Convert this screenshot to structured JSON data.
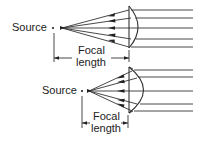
{
  "figure": {
    "colors": {
      "ink": "#222222",
      "background": "#ffffff"
    },
    "top_diagram": {
      "source_label": "Source",
      "focal_label_line1": "Focal",
      "focal_label_line2": "length"
    },
    "bottom_diagram": {
      "source_label": "Source",
      "focal_label_line1": "Focal",
      "focal_label_line2": "length"
    }
  }
}
